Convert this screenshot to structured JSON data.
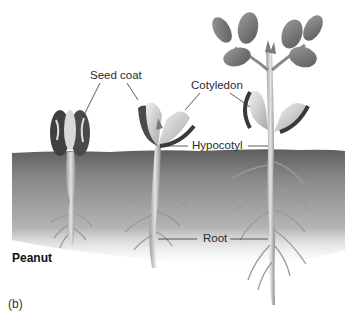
{
  "figure": {
    "panel_label": "(b)",
    "species_label": "Peanut",
    "labels": {
      "seed_coat": "Seed coat",
      "cotyledon": "Cotyledon",
      "hypocotyl": "Hypocotyl",
      "root": "Root"
    },
    "stages": [
      {
        "name": "early-seedling",
        "description": "Seed coat splitting, short root"
      },
      {
        "name": "middle-seedling",
        "description": "Cotyledons opening above soil"
      },
      {
        "name": "late-seedling",
        "description": "Leaves expanded, branched roots"
      }
    ],
    "colors": {
      "soil_dark": "#6b6b6b",
      "soil_light": "#c8c8c8",
      "stem": "#d2d2d2",
      "leaf": "#7a7a7a",
      "seed_coat": "#3c3c3c",
      "label_text": "#2a2a2a"
    }
  }
}
